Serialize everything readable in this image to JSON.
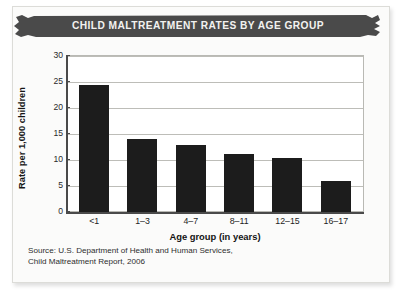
{
  "banner": {
    "title": "CHILD MALTREATMENT RATES BY AGE GROUP",
    "color": "#4a4a4a",
    "text_color": "#f2f2f0"
  },
  "source": {
    "line1": "Source: U.S. Department of Health and Human Services,",
    "line2": "Child Maltreatment Report, 2006"
  },
  "chart_data": {
    "type": "bar",
    "title": "CHILD MALTREATMENT RATES BY AGE GROUP",
    "subtitle": "",
    "categories": [
      "<1",
      "1–3",
      "4–7",
      "8–11",
      "12–15",
      "16–17"
    ],
    "values": [
      24.2,
      14.0,
      12.8,
      11.0,
      10.3,
      6.0
    ],
    "series": [
      {
        "name": "Rate per 1,000 children",
        "values": [
          24.2,
          14.0,
          12.8,
          11.0,
          10.3,
          6.0
        ]
      }
    ],
    "xlabel": "Age group (in years)",
    "ylabel": "Rate per 1,000 children",
    "ylim": [
      0,
      30
    ],
    "yticks": [
      0,
      5,
      10,
      15,
      20,
      25,
      30
    ],
    "ytick_labels": [
      "0",
      "5",
      "10",
      "15",
      "20",
      "25",
      "30"
    ],
    "grid": true,
    "legend": false,
    "legend_position": "none",
    "bar_color": "#1c1c1c",
    "gridline_color": "#bdbdb8",
    "axis_color": "#4a4a4a",
    "annotations": [
      "Source: U.S. Department of Health and Human Services,",
      "Child Maltreatment Report, 2006"
    ]
  }
}
